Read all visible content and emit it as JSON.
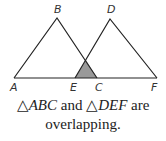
{
  "diagram": {
    "points": {
      "A": {
        "label": "A",
        "x": 14,
        "y": 78
      },
      "B": {
        "label": "B",
        "x": 57,
        "y": 18
      },
      "C": {
        "label": "C",
        "x": 97,
        "y": 78
      },
      "D": {
        "label": "D",
        "x": 110,
        "y": 19
      },
      "E": {
        "label": "E",
        "x": 75,
        "y": 78
      },
      "F": {
        "label": "F",
        "x": 157,
        "y": 78
      }
    },
    "triangles": [
      "ABC",
      "DEF"
    ],
    "overlap_region_color": "#999999",
    "line_color": "#222222"
  },
  "caption": {
    "tri_symbol": "△",
    "tri1": "ABC",
    "and": " and ",
    "tri2": "DEF",
    "line1_end": " are",
    "line2": "overlapping."
  }
}
